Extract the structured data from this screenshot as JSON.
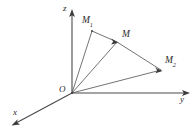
{
  "figure": {
    "kind": "vector-diagram",
    "background_color": "#ffffff",
    "line_color": "#5a5a5a",
    "axis_color": "#4a4a4a",
    "label_color": "#2b2b2b",
    "width": 195,
    "height": 140
  },
  "axes": [
    {
      "id": "z",
      "label": "z",
      "label_x": 63,
      "label_y": 6,
      "from": [
        72,
        93
      ],
      "to": [
        72,
        13
      ],
      "arrow": true
    },
    {
      "id": "y",
      "label": "y",
      "label_x": 180,
      "label_y": 96,
      "from": [
        72,
        93
      ],
      "to": [
        186,
        93
      ],
      "arrow": true
    },
    {
      "id": "x",
      "label": "x",
      "label_x": 14,
      "label_y": 109,
      "from": [
        72,
        93
      ],
      "to": [
        14,
        124
      ],
      "arrow": true
    }
  ],
  "origin": {
    "label": "O",
    "label_x": 59,
    "label_y": 86,
    "point": [
      72,
      93
    ]
  },
  "points": [
    {
      "id": "M1",
      "label": "M",
      "subscript": "1",
      "label_x": 82,
      "label_y": 17,
      "point": [
        92,
        31
      ]
    },
    {
      "id": "M",
      "label": "M",
      "subscript": "",
      "label_x": 122,
      "label_y": 31,
      "point": [
        117,
        42
      ]
    },
    {
      "id": "M2",
      "label": "M",
      "subscript": "2",
      "label_x": 165,
      "label_y": 57,
      "point": [
        161,
        70
      ]
    }
  ],
  "vectors": [
    {
      "id": "OM1",
      "from": [
        72,
        93
      ],
      "to": [
        92,
        31
      ],
      "arrow": false
    },
    {
      "id": "OM",
      "from": [
        72,
        93
      ],
      "to": [
        117,
        42
      ],
      "arrow": true
    },
    {
      "id": "OM2",
      "from": [
        72,
        93
      ],
      "to": [
        161,
        70
      ],
      "arrow": false
    }
  ],
  "chords": [
    {
      "id": "M1-M",
      "from": [
        92,
        31
      ],
      "to": [
        117,
        42
      ],
      "arrow": true
    },
    {
      "id": "M-M2",
      "from": [
        117,
        42
      ],
      "to": [
        161,
        70
      ],
      "arrow": true
    }
  ]
}
